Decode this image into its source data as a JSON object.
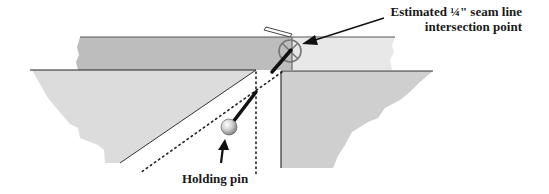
{
  "diagram": {
    "labels": {
      "seam_point_line1": "Estimated ¼\" seam line",
      "seam_point_line2": "intersection point",
      "holding_pin": "Holding pin"
    },
    "colors": {
      "top_strip_dark": "#bdbdbd",
      "top_strip_light": "#e6e6e6",
      "left_fabric": "#dedede",
      "right_fabric": "#cfcfcf",
      "outline": "#333333",
      "pin_head": "#c8c8c8"
    },
    "elements": [
      {
        "name": "top-fabric-strip",
        "description": "horizontal strip, darker left half, lighter right half"
      },
      {
        "name": "left-fabric-piece",
        "description": "light gray piece with diagonal cut edge"
      },
      {
        "name": "right-fabric-piece",
        "description": "gray piece with vertical left edge"
      },
      {
        "name": "seam-intersection-marker",
        "description": "circle with X cross"
      },
      {
        "name": "holding-pin",
        "description": "round-headed pin through fabric"
      },
      {
        "name": "dotted-guide-lines",
        "description": "vertical and diagonal dotted lines"
      }
    ]
  }
}
